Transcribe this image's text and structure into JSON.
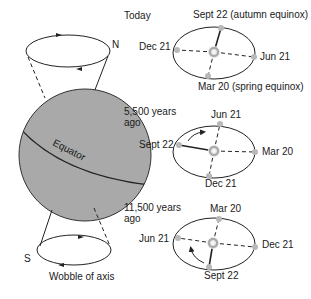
{
  "earth": {
    "north_label": "N",
    "south_label": "S",
    "equator_label": "Equator",
    "caption": "Wobble of axis",
    "fill_color": "#a9a9a9"
  },
  "orbits": [
    {
      "title_line1": "Today",
      "title_line2": "",
      "top": "Sept 22 (autumn equinox)",
      "left": "Dec 21",
      "right": "Jun 21",
      "bottom": "Mar 20 (spring equinox)",
      "solid_point": "top",
      "has_arrow": false
    },
    {
      "title_line1": "5,500 years",
      "title_line2": "ago",
      "top": "Jun 21",
      "left": "Sept 22",
      "right": "Mar 20",
      "bottom": "Dec 21",
      "solid_point": "left",
      "has_arrow": true
    },
    {
      "title_line1": "11,500 years",
      "title_line2": "ago",
      "top": "Mar 20",
      "left": "Jun 21",
      "right": "Dec 21",
      "bottom": "Sept 22",
      "solid_point": "bottom",
      "has_arrow": true
    }
  ],
  "colors": {
    "line": "#222222",
    "point": "#b8b8b8",
    "sun": "#c8c8c8"
  }
}
